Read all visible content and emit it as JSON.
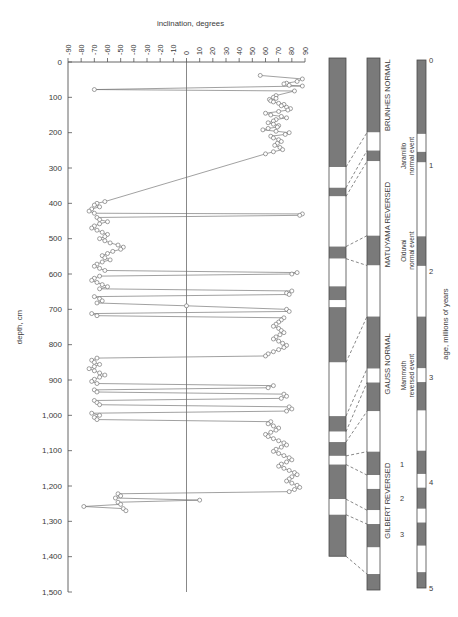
{
  "figure": {
    "x_axis": {
      "title": "inclination, degrees",
      "ticks": [
        -90,
        -80,
        -70,
        -60,
        -50,
        -40,
        -30,
        -20,
        -10,
        0,
        10,
        20,
        30,
        40,
        50,
        60,
        70,
        80,
        90
      ],
      "tick_labels": [
        "-90",
        "-80",
        "-70",
        "-60",
        "-50",
        "-40",
        "-30",
        "-20",
        "-10",
        "0",
        "10",
        "20",
        "30",
        "40",
        "50",
        "60",
        "70",
        "80",
        "90"
      ],
      "min": -90,
      "max": 90
    },
    "y_axis": {
      "title": "depth, cm",
      "ticks": [
        0,
        100,
        200,
        300,
        400,
        500,
        600,
        700,
        800,
        900,
        1000,
        1100,
        1200,
        1300,
        1400,
        1500
      ],
      "tick_labels": [
        "0",
        "100",
        "200",
        "300",
        "400",
        "500",
        "600",
        "700",
        "800",
        "900",
        "1,000",
        "1,100",
        "1,200",
        "1,300",
        "1,400",
        "1,500"
      ],
      "min": 0,
      "max": 1500
    },
    "marker": "open-circle",
    "line_color": "#6a6a6a"
  },
  "chart_data": {
    "type": "line",
    "title": "inclination, degrees",
    "xlabel": "inclination, degrees",
    "ylabel": "depth, cm",
    "xlim": [
      -90,
      90
    ],
    "ylim": [
      1500,
      0
    ],
    "grid": false,
    "legend": "none",
    "series": [
      {
        "name": "inclination",
        "x": [
          56,
          88,
          84,
          76,
          74,
          78,
          88,
          -70,
          82,
          68,
          66,
          68,
          63,
          64,
          66,
          70,
          74,
          72,
          76,
          79,
          77,
          70,
          60,
          64,
          72,
          76,
          68,
          66,
          62,
          66,
          70,
          69,
          62,
          58,
          68,
          78,
          75,
          64,
          66,
          70,
          72,
          69,
          67,
          71,
          73,
          66,
          60,
          -62,
          -68,
          -70,
          -66,
          -72,
          -74,
          -70,
          88,
          86,
          -68,
          -66,
          -60,
          -66,
          -70,
          -72,
          -68,
          -64,
          -60,
          -62,
          -66,
          -62,
          -58,
          -52,
          -48,
          -50,
          -56,
          -60,
          -64,
          -62,
          -58,
          -64,
          -68,
          -70,
          -66,
          -62,
          84,
          80,
          -66,
          -70,
          -72,
          -68,
          -64,
          -60,
          -66,
          80,
          76,
          78,
          -70,
          -66,
          -64,
          -68,
          0,
          76,
          78,
          -72,
          -68,
          74,
          72,
          70,
          68,
          66,
          70,
          72,
          74,
          71,
          68,
          66,
          70,
          73,
          76,
          74,
          70,
          66,
          62,
          60,
          -68,
          -72,
          -70,
          -66,
          -70,
          -74,
          -70,
          -66,
          -62,
          -66,
          -70,
          -72,
          -68,
          66,
          62,
          -70,
          -68,
          74,
          76,
          72,
          -70,
          -68,
          -66,
          78,
          80,
          76,
          -72,
          -66,
          -70,
          -68,
          64,
          62,
          66,
          70,
          68,
          64,
          60,
          62,
          66,
          70,
          74,
          76,
          72,
          68,
          66,
          70,
          74,
          78,
          80,
          76,
          72,
          70,
          74,
          78,
          82,
          84,
          80,
          78,
          76,
          80,
          84,
          86,
          82,
          78,
          -52,
          -50,
          -54,
          10,
          -52,
          -50,
          -78,
          -48,
          -46
        ],
        "y": [
          38,
          48,
          55,
          60,
          62,
          66,
          68,
          78,
          82,
          95,
          100,
          103,
          106,
          110,
          113,
          117,
          120,
          124,
          128,
          132,
          136,
          140,
          145,
          150,
          154,
          158,
          163,
          167,
          172,
          176,
          180,
          184,
          188,
          192,
          196,
          200,
          205,
          210,
          215,
          220,
          225,
          230,
          236,
          242,
          248,
          254,
          260,
          395,
          400,
          405,
          410,
          416,
          422,
          428,
          430,
          434,
          440,
          446,
          452,
          458,
          464,
          470,
          476,
          482,
          488,
          494,
          500,
          506,
          512,
          518,
          524,
          530,
          536,
          542,
          548,
          554,
          560,
          566,
          572,
          578,
          584,
          590,
          596,
          600,
          606,
          612,
          618,
          624,
          630,
          636,
          642,
          648,
          654,
          658,
          664,
          670,
          676,
          682,
          690,
          700,
          706,
          712,
          718,
          724,
          730,
          736,
          742,
          748,
          754,
          760,
          766,
          772,
          778,
          784,
          790,
          796,
          802,
          808,
          814,
          820,
          826,
          832,
          838,
          844,
          850,
          856,
          862,
          868,
          874,
          880,
          886,
          892,
          898,
          904,
          910,
          916,
          922,
          928,
          934,
          940,
          946,
          952,
          958,
          964,
          970,
          976,
          982,
          988,
          994,
          1000,
          1006,
          1012,
          1018,
          1024,
          1030,
          1036,
          1042,
          1048,
          1054,
          1060,
          1066,
          1072,
          1078,
          1084,
          1090,
          1096,
          1102,
          1108,
          1114,
          1120,
          1126,
          1132,
          1138,
          1144,
          1150,
          1156,
          1162,
          1168,
          1174,
          1180,
          1186,
          1192,
          1198,
          1204,
          1210,
          1216,
          1222,
          1228,
          1234,
          1240,
          1246,
          1252,
          1258,
          1264,
          1270
        ]
      }
    ]
  },
  "core_polarity_column": {
    "name": "core polarity log",
    "bands": [
      {
        "polarity": "normal",
        "top_cm": 0,
        "bottom_cm": 315
      },
      {
        "polarity": "reversed",
        "top_cm": 315,
        "bottom_cm": 375
      },
      {
        "polarity": "normal",
        "top_cm": 375,
        "bottom_cm": 400
      },
      {
        "polarity": "reversed",
        "top_cm": 400,
        "bottom_cm": 545
      },
      {
        "polarity": "normal",
        "top_cm": 545,
        "bottom_cm": 580
      },
      {
        "polarity": "reversed",
        "top_cm": 580,
        "bottom_cm": 660
      },
      {
        "polarity": "normal",
        "top_cm": 660,
        "bottom_cm": 700
      },
      {
        "polarity": "reversed",
        "top_cm": 700,
        "bottom_cm": 720
      },
      {
        "polarity": "normal",
        "top_cm": 720,
        "bottom_cm": 880
      },
      {
        "polarity": "reversed",
        "top_cm": 880,
        "bottom_cm": 1035
      },
      {
        "polarity": "normal",
        "top_cm": 1035,
        "bottom_cm": 1080
      },
      {
        "polarity": "reversed",
        "top_cm": 1080,
        "bottom_cm": 1110
      },
      {
        "polarity": "normal",
        "top_cm": 1110,
        "bottom_cm": 1150
      },
      {
        "polarity": "reversed",
        "top_cm": 1150,
        "bottom_cm": 1175
      },
      {
        "polarity": "normal",
        "top_cm": 1175,
        "bottom_cm": 1275
      },
      {
        "polarity": "reversed",
        "top_cm": 1275,
        "bottom_cm": 1320
      },
      {
        "polarity": "normal",
        "top_cm": 1320,
        "bottom_cm": 1440
      }
    ]
  },
  "timescale_column": {
    "name": "magnetic polarity time scale",
    "bands": [
      {
        "polarity": "normal",
        "top_my": 0.0,
        "bottom_my": 0.7
      },
      {
        "polarity": "reversed",
        "top_my": 0.7,
        "bottom_my": 0.87
      },
      {
        "polarity": "normal",
        "top_my": 0.87,
        "bottom_my": 0.97
      },
      {
        "polarity": "reversed",
        "top_my": 0.97,
        "bottom_my": 1.67
      },
      {
        "polarity": "normal",
        "top_my": 1.67,
        "bottom_my": 1.95
      },
      {
        "polarity": "reversed",
        "top_my": 1.95,
        "bottom_my": 2.43
      },
      {
        "polarity": "normal",
        "top_my": 2.43,
        "bottom_my": 2.92
      },
      {
        "polarity": "reversed",
        "top_my": 2.92,
        "bottom_my": 3.05
      },
      {
        "polarity": "normal",
        "top_my": 3.05,
        "bottom_my": 3.32
      },
      {
        "polarity": "reversed",
        "top_my": 3.32,
        "bottom_my": 3.7
      },
      {
        "polarity": "normal",
        "top_my": 3.7,
        "bottom_my": 3.92
      },
      {
        "polarity": "reversed",
        "top_my": 3.92,
        "bottom_my": 4.05
      },
      {
        "polarity": "normal",
        "top_my": 4.05,
        "bottom_my": 4.25
      },
      {
        "polarity": "reversed",
        "top_my": 4.25,
        "bottom_my": 4.38
      },
      {
        "polarity": "normal",
        "top_my": 4.38,
        "bottom_my": 4.6
      },
      {
        "polarity": "reversed",
        "top_my": 4.6,
        "bottom_my": 4.85
      },
      {
        "polarity": "normal",
        "top_my": 4.85,
        "bottom_my": 5.0
      }
    ],
    "epochs": [
      {
        "label": "BRUNHES NORMAL",
        "top_my": 0.0,
        "bottom_my": 0.7
      },
      {
        "label": "MATUYAMA REVERSED",
        "top_my": 0.7,
        "bottom_my": 2.43
      },
      {
        "label": "GAUSS NORMAL",
        "top_my": 2.43,
        "bottom_my": 3.32
      },
      {
        "label": "GILBERT REVERSED",
        "top_my": 3.32,
        "bottom_my": 5.0
      }
    ],
    "events": [
      {
        "label": "Jaramillo\nnormal event",
        "line1": "Jaramillo",
        "line2": "normal event",
        "top_my": 0.87,
        "bottom_my": 0.97
      },
      {
        "label": "Olduvai\nnormal event",
        "line1": "Olduvai",
        "line2": "normal event",
        "top_my": 1.67,
        "bottom_my": 1.95
      },
      {
        "label": "Mammoth\nreversed event",
        "line1": "Mammoth",
        "line2": "reversed event",
        "top_my": 2.92,
        "bottom_my": 3.05
      }
    ],
    "numbered_events": [
      {
        "number": "1",
        "at_my": 3.82
      },
      {
        "number": "2",
        "at_my": 4.14
      },
      {
        "number": "3",
        "at_my": 4.48
      }
    ]
  },
  "age_scale": {
    "title": "age, millions of years",
    "ticks": [
      0,
      1,
      2,
      3,
      4,
      5
    ],
    "tick_labels": [
      "0",
      "1",
      "2",
      "3",
      "4",
      "5"
    ],
    "min": 0,
    "max": 5,
    "bands": [
      {
        "polarity": "normal",
        "top_my": 0.0,
        "bottom_my": 0.7
      },
      {
        "polarity": "reversed",
        "top_my": 0.7,
        "bottom_my": 0.87
      },
      {
        "polarity": "normal",
        "top_my": 0.87,
        "bottom_my": 0.97
      },
      {
        "polarity": "reversed",
        "top_my": 0.97,
        "bottom_my": 1.67
      },
      {
        "polarity": "normal",
        "top_my": 1.67,
        "bottom_my": 1.95
      },
      {
        "polarity": "reversed",
        "top_my": 1.95,
        "bottom_my": 2.43
      },
      {
        "polarity": "normal",
        "top_my": 2.43,
        "bottom_my": 2.92
      },
      {
        "polarity": "reversed",
        "top_my": 2.92,
        "bottom_my": 3.05
      },
      {
        "polarity": "normal",
        "top_my": 3.05,
        "bottom_my": 3.32
      },
      {
        "polarity": "reversed",
        "top_my": 3.32,
        "bottom_my": 3.7
      },
      {
        "polarity": "normal",
        "top_my": 3.7,
        "bottom_my": 3.92
      },
      {
        "polarity": "reversed",
        "top_my": 3.92,
        "bottom_my": 4.05
      },
      {
        "polarity": "normal",
        "top_my": 4.05,
        "bottom_my": 4.25
      },
      {
        "polarity": "reversed",
        "top_my": 4.25,
        "bottom_my": 4.38
      },
      {
        "polarity": "normal",
        "top_my": 4.38,
        "bottom_my": 4.6
      },
      {
        "polarity": "reversed",
        "top_my": 4.6,
        "bottom_my": 4.85
      },
      {
        "polarity": "normal",
        "top_my": 4.85,
        "bottom_my": 5.0
      }
    ]
  },
  "correlation_lines": [
    {
      "from_cm": 315,
      "to_my": 0.7
    },
    {
      "from_cm": 375,
      "to_my": 0.87
    },
    {
      "from_cm": 400,
      "to_my": 0.97
    },
    {
      "from_cm": 545,
      "to_my": 1.67
    },
    {
      "from_cm": 580,
      "to_my": 1.95
    },
    {
      "from_cm": 880,
      "to_my": 2.43
    },
    {
      "from_cm": 1035,
      "to_my": 2.92
    },
    {
      "from_cm": 1080,
      "to_my": 3.05
    },
    {
      "from_cm": 1110,
      "to_my": 3.32
    },
    {
      "from_cm": 1150,
      "to_my": 3.7
    },
    {
      "from_cm": 1175,
      "to_my": 3.92
    },
    {
      "from_cm": 1275,
      "to_my": 4.25
    },
    {
      "from_cm": 1320,
      "to_my": 4.38
    },
    {
      "from_cm": 1440,
      "to_my": 4.85
    }
  ],
  "colors": {
    "dark_band": "#7a7a7a",
    "light_band": "#ffffff",
    "band_border": "#4a4a4a",
    "axis": "#555555",
    "data_line": "#6e6e6e",
    "text": "#3a3a3a"
  }
}
